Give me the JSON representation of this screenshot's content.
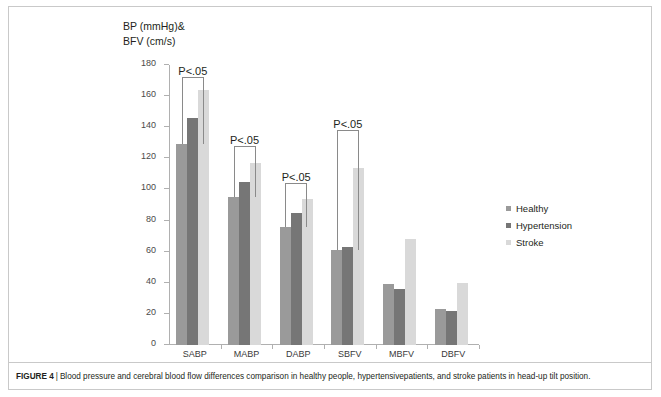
{
  "figure": {
    "label": "FIGURE 4",
    "separator": "|",
    "caption": "Blood pressure and cerebral blood flow differences comparison in healthy people, hypertensivepatients, and stroke patients in head-up tilt position."
  },
  "axis_title": {
    "line1": "BP (mmHg)&",
    "line2": "BFV (cm/s)"
  },
  "legend": {
    "items": [
      {
        "label": "Healthy",
        "color": "#9a9a9a"
      },
      {
        "label": "Hypertension",
        "color": "#767676"
      },
      {
        "label": "Stroke",
        "color": "#d9d9d9"
      }
    ]
  },
  "chart_data": {
    "type": "bar",
    "title": "",
    "xlabel": "",
    "ylabel": "BP (mmHg)& BFV (cm/s)",
    "ylim": [
      0,
      180
    ],
    "ytick_step": 20,
    "yticks": [
      0,
      20,
      40,
      60,
      80,
      100,
      120,
      140,
      160,
      180
    ],
    "ytick_labels": [
      "0",
      "20",
      "40",
      "60",
      "80",
      "100",
      "120",
      "140",
      "160",
      "180"
    ],
    "grid": false,
    "legend_position": "right",
    "categories": [
      "SABP",
      "MABP",
      "DABP",
      "SBFV",
      "MBFV",
      "DBFV"
    ],
    "series": [
      {
        "name": "Healthy",
        "color": "#9a9a9a",
        "values": [
          129,
          95,
          76,
          61,
          39,
          23
        ]
      },
      {
        "name": "Hypertension",
        "color": "#767676",
        "values": [
          146,
          105,
          85,
          63,
          36,
          22
        ]
      },
      {
        "name": "Stroke",
        "color": "#d9d9d9",
        "values": [
          164,
          117,
          94,
          114,
          68,
          40
        ]
      }
    ],
    "annotations": [
      {
        "text": "P<.05",
        "category": "SABP",
        "from_series": "Healthy",
        "to_series": "Stroke",
        "bracket_top": 172
      },
      {
        "text": "P<.05",
        "category": "MABP",
        "from_series": "Healthy",
        "to_series": "Stroke",
        "bracket_top": 128
      },
      {
        "text": "P<.05",
        "category": "DABP",
        "from_series": "Healthy",
        "to_series": "Stroke",
        "bracket_top": 104
      },
      {
        "text": "P<.05",
        "category": "SBFV",
        "from_series": "Healthy",
        "to_series": "Stroke",
        "bracket_top": 138
      }
    ]
  }
}
